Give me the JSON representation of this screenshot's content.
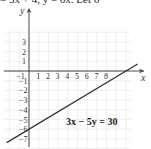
{
  "top_text_fragment": "= 3x + 4,  y = 6x. Let 6",
  "chart_data": {
    "type": "line",
    "title": "",
    "equation_label": "3x − 5y = 30",
    "xlabel": "x",
    "ylabel": "y",
    "xlim": [
      -2,
      11
    ],
    "ylim": [
      -8,
      4
    ],
    "x_ticks": [
      "-1",
      "1",
      "2",
      "3",
      "4",
      "5",
      "6",
      "7",
      "8"
    ],
    "y_ticks": [
      "3",
      "2",
      "1",
      "-1",
      "-2",
      "-3",
      "-4",
      "-5",
      "-6",
      "-7"
    ],
    "grid": true,
    "series": [
      {
        "name": "3x - 5y = 30",
        "x": [
          -2,
          10,
          11
        ],
        "y": [
          -7.2,
          0,
          0.6
        ],
        "intercepts": {
          "x": 10,
          "y": -6
        }
      }
    ]
  }
}
